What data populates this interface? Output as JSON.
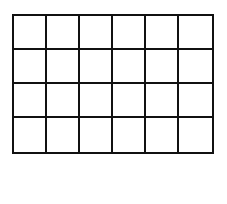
{
  "grid": {
    "rows": 4,
    "columns": 6,
    "line_color": "#111111",
    "fill_color": "#ffffff",
    "cells": [
      [
        "",
        "",
        "",
        "",
        "",
        ""
      ],
      [
        "",
        "",
        "",
        "",
        "",
        ""
      ],
      [
        "",
        "",
        "",
        "",
        "",
        ""
      ],
      [
        "",
        "",
        "",
        "",
        "",
        ""
      ]
    ]
  }
}
